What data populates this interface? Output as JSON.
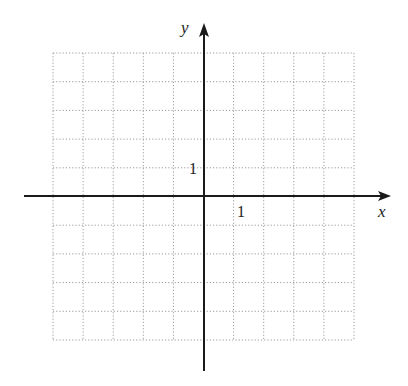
{
  "diagram": {
    "type": "coordinate-grid",
    "x_axis_label": "x",
    "y_axis_label": "y",
    "x_tick_label": "1",
    "y_tick_label": "1",
    "grid": {
      "columns": 10,
      "rows": 10,
      "left": 53,
      "top": 53,
      "right": 354,
      "bottom": 340,
      "style": "dotted",
      "color": "#9a9a9a"
    },
    "origin": {
      "x": 204,
      "y": 196
    },
    "axis_color": "#1a1a1a"
  }
}
